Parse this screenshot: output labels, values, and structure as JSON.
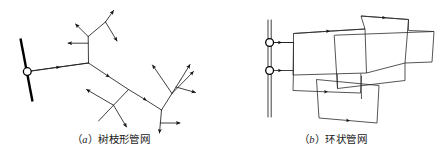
{
  "figure": {
    "background_color": "#ffffff",
    "line_color": "#1f1f1f",
    "node_fill_color": "#ffffff",
    "arrow_color": "#111111"
  },
  "panels": [
    {
      "id": "a",
      "caption_open": "（",
      "caption_label": "a",
      "caption_close": "）",
      "caption_text": "树枝形管网",
      "caption_full": "（a）树枝形管网",
      "diagram_type": "branched-pipe-network",
      "source_main": "thick slanted supply main",
      "source_node": "circular junction node",
      "branch_count": 14
    },
    {
      "id": "b",
      "caption_open": "（",
      "caption_label": "b",
      "caption_close": "）",
      "caption_text": "环状管网",
      "caption_full": "（b）环状管网",
      "diagram_type": "looped-ring-pipe-network",
      "source_main": "double-line vertical supply main",
      "source_node_count": 2,
      "loop_count": 6
    }
  ]
}
